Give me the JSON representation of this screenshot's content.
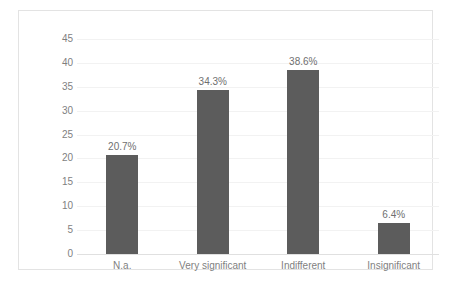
{
  "chart_data": {
    "type": "bar",
    "title": "",
    "subtitle": "",
    "xlabel": "",
    "ylabel": "",
    "categories": [
      "N.a.",
      "Very significant",
      "Indifferent",
      "Insignificant"
    ],
    "values": [
      20.7,
      34.3,
      38.6,
      6.4
    ],
    "data_labels": [
      "20.7%",
      "34.3%",
      "38.6%",
      "6.4%"
    ],
    "ylim": [
      0,
      45
    ],
    "ytick_values": [
      0,
      5,
      10,
      15,
      20,
      25,
      30,
      35,
      40,
      45
    ],
    "ytick_labels": [
      "0",
      "5",
      "10",
      "15",
      "20",
      "25",
      "30",
      "35",
      "40",
      "45"
    ],
    "grid": true,
    "legend": false,
    "legend_position": "none",
    "series": [
      {
        "name": "",
        "values": [
          20.7,
          34.3,
          38.6,
          6.4
        ]
      }
    ],
    "colors": {
      "bar_fill": "#5c5c5c",
      "gridline": "#f2f2f2",
      "axis_text": "#7f7f7f",
      "data_label_text": "#6f6f6f",
      "frame_border": "#e3e3e3",
      "plot_background": "#ffffff"
    }
  }
}
